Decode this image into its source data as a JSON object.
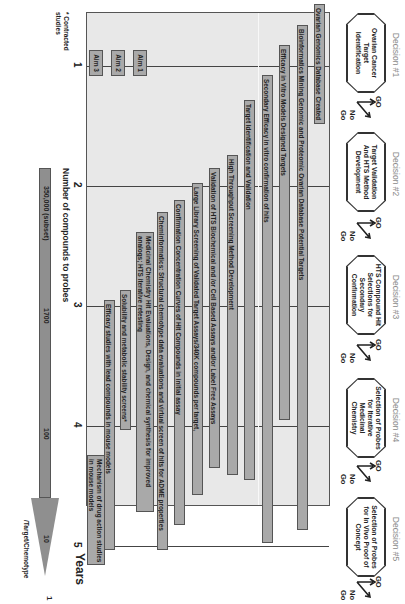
{
  "decisions": [
    {
      "label": "Decision #1",
      "box": "Ovarian Cancer Target Identification"
    },
    {
      "label": "Decision #2",
      "box": "Target Validation And HTS Method Development"
    },
    {
      "label": "Decision #3",
      "box": "HTS Compound Hit Selections for Secondary Confirmation"
    },
    {
      "label": "Decision #4",
      "box": "Selection of Probes for Iterative Medicinal Chemistry"
    },
    {
      "label": "Decision #5",
      "box": "Selection of Probes for In Vivo Proof of Concept"
    }
  ],
  "gonogo": {
    "go": "GO",
    "nogo": "No Go"
  },
  "bars": [
    {
      "label": "Ovarian Genomics Database Created"
    },
    {
      "label": "Bioinformatics Mining Genomic and Proteomic Ovarian Database Potential Targets"
    },
    {
      "label": "Efficacy in Vitro Models Designed Targets"
    },
    {
      "label": "Secondary Efficacy in vitro confirmation of hits"
    },
    {
      "label": "Target Identification and Validation"
    },
    {
      "label": "High Throughput Screening Method Development"
    },
    {
      "label": "Validation of HTS Biochemical and /or Cell Based Assays and/or Label Free Assays"
    },
    {
      "label": "Large Library Screening of Validated Target Assays/340K compounds per target,"
    },
    {
      "label": "Confirmation Concentration Curves of Hit Compounds in initial assay"
    },
    {
      "label": "Cheminformatics: Structural chemotype data evaluations and virtual screen of hits for ADME properties"
    },
    {
      "label": "Medicinal Chemistry Hit Evaluations, Design, and chemical synthesis for improved analogs; HTS iterative retesting"
    },
    {
      "label": "Solubility and metabolic stability screens*"
    },
    {
      "label": "Efficacy studies with lead compounds in mouse models"
    },
    {
      "label": "Mechanism of drug action studies in mouse models"
    }
  ],
  "aims": [
    "Aim 1",
    "Aim 2",
    "Aim 3"
  ],
  "years": {
    "ticks": [
      "1",
      "2",
      "3",
      "4",
      "5"
    ],
    "label": "Years"
  },
  "footnote": "* Contracted studies",
  "compounds": {
    "label": "Number of compounds to probes",
    "values": [
      "350,000 (subset)",
      "1700",
      "100",
      "10"
    ],
    "end_value": "1",
    "end_label": "/Target/Chemotype"
  }
}
